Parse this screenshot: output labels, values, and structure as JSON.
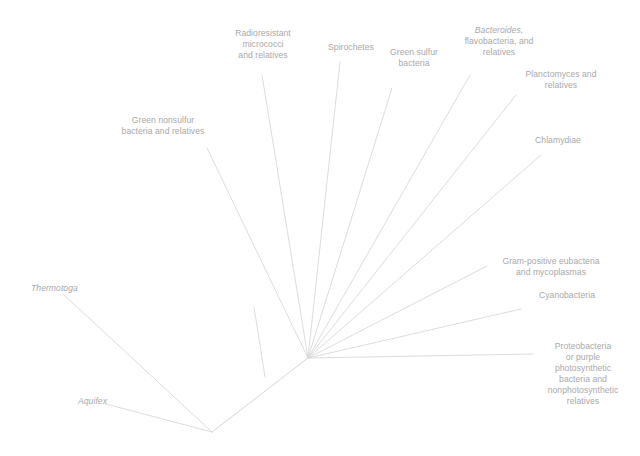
{
  "figure": {
    "type": "phylogenetic-tree",
    "style": "unrooted radial phylogram",
    "background_color": "#ffffff",
    "line_color": "#d8d8d8",
    "text_color": "#a9a9a9"
  },
  "taxa": [
    {
      "id": "green-nonsulfur",
      "lines": [
        {
          "text": "Green nonsulfur",
          "italic": false
        },
        {
          "text": "bacteria and relatives",
          "italic": false
        }
      ],
      "align": "center",
      "x": 113,
      "y": 115,
      "width": 100
    },
    {
      "id": "radioresistant-micrococci",
      "lines": [
        {
          "text": "Radioresistant",
          "italic": false
        },
        {
          "text": "micrococci",
          "italic": false
        },
        {
          "text": "and relatives",
          "italic": false
        }
      ],
      "align": "center",
      "x": 223,
      "y": 28,
      "width": 80
    },
    {
      "id": "spirochetes",
      "lines": [
        {
          "text": "Spirochetes",
          "italic": false
        }
      ],
      "align": "center",
      "x": 318,
      "y": 42,
      "width": 66
    },
    {
      "id": "green-sulfur-bacteria",
      "lines": [
        {
          "text": "Green sulfur",
          "italic": false
        },
        {
          "text": "bacteria",
          "italic": false
        }
      ],
      "align": "center",
      "x": 378,
      "y": 47,
      "width": 72
    },
    {
      "id": "bacteroides-flavobacteria",
      "lines": [
        {
          "text": "Bacteroides,",
          "italic": true
        },
        {
          "text": "flavobacteria, and",
          "italic": false
        },
        {
          "text": "relatives",
          "italic": false
        }
      ],
      "align": "center",
      "x": 453,
      "y": 25,
      "width": 92
    },
    {
      "id": "planctomyces",
      "lines": [
        {
          "text": "Planctomyces and",
          "italic": false
        },
        {
          "text": "relatives",
          "italic": false
        }
      ],
      "align": "center",
      "x": 513,
      "y": 69,
      "width": 96
    },
    {
      "id": "chlamydiae",
      "lines": [
        {
          "text": "Chlamydiae",
          "italic": false
        }
      ],
      "align": "center",
      "x": 523,
      "y": 135,
      "width": 70
    },
    {
      "id": "gram-positive-eubacteria",
      "lines": [
        {
          "text": "Gram-positive eubacteria",
          "italic": false
        },
        {
          "text": "and mycoplasmas",
          "italic": false
        }
      ],
      "align": "center",
      "x": 487,
      "y": 256,
      "width": 128
    },
    {
      "id": "cyanobacteria",
      "lines": [
        {
          "text": "Cyanobacteria",
          "italic": false
        }
      ],
      "align": "center",
      "x": 527,
      "y": 290,
      "width": 80
    },
    {
      "id": "proteobacteria",
      "lines": [
        {
          "text": "Proteobacteria",
          "italic": false
        },
        {
          "text": "or purple",
          "italic": false
        },
        {
          "text": "photosynthetic",
          "italic": false
        },
        {
          "text": "bacteria and",
          "italic": false
        },
        {
          "text": "nonphotosynthetic",
          "italic": false
        },
        {
          "text": "relatives",
          "italic": false
        }
      ],
      "align": "center",
      "x": 533,
      "y": 341,
      "width": 100
    },
    {
      "id": "thermotoga",
      "lines": [
        {
          "text": "Thermotoga",
          "italic": true
        }
      ],
      "align": "left",
      "x": 31,
      "y": 283,
      "width": 80
    },
    {
      "id": "aquifex",
      "lines": [
        {
          "text": "Aquifex",
          "italic": true
        }
      ],
      "align": "left",
      "x": 78,
      "y": 396,
      "width": 60
    }
  ],
  "branches": [
    {
      "id": "branch-green-nonsulfur",
      "path": "M 308 358 L 207 148"
    },
    {
      "id": "branch-radioresistant",
      "path": "M 308 358 L 262 75"
    },
    {
      "id": "branch-spirochetes",
      "path": "M 308 358 L 340 62"
    },
    {
      "id": "branch-green-sulfur",
      "path": "M 308 358 L 392 88"
    },
    {
      "id": "branch-bacteroides",
      "path": "M 308 358 L 470 75"
    },
    {
      "id": "branch-planctomyces",
      "path": "M 308 358 L 516 95"
    },
    {
      "id": "branch-chlamydiae",
      "path": "M 308 358 L 541 155"
    },
    {
      "id": "branch-gram-positive",
      "path": "M 308 358 L 487 266"
    },
    {
      "id": "branch-cyanobacteria",
      "path": "M 308 358 L 521 309"
    },
    {
      "id": "branch-proteobacteria",
      "path": "M 308 358 L 533 354"
    },
    {
      "id": "trunk-hub-to-node",
      "path": "M 308 358 L 212 432"
    },
    {
      "id": "branch-thermotoga",
      "path": "M 212 432 L 63 294"
    },
    {
      "id": "branch-aquifex",
      "path": "M 212 432 L 106 404"
    },
    {
      "id": "branch-internal-stem",
      "path": "M 265 377 L 254 307"
    }
  ]
}
